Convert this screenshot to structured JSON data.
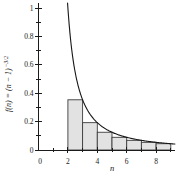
{
  "chart_data": {
    "type": "bar+line",
    "title": "",
    "xlabel": "n",
    "ylabel": "f(n) = (n − 1)^(−3/2)",
    "ylabel_main": "f(n) = (n − 1)",
    "ylabel_superscript": "−3/2",
    "xlim": [
      0,
      9.3
    ],
    "ylim": [
      0,
      1.04
    ],
    "grid": false,
    "x_ticks_major": [
      0,
      2,
      4,
      6,
      8
    ],
    "x_tick_labels": [
      "0",
      "2",
      "4",
      "6",
      "8"
    ],
    "x_ticks_minor": [
      1,
      3,
      5,
      7,
      9
    ],
    "y_ticks_major": [
      0,
      0.2,
      0.4,
      0.6,
      0.8,
      1
    ],
    "y_tick_labels": [
      "0",
      "0.2",
      "0.4",
      "0.6",
      "0.8",
      "1"
    ],
    "y_ticks_minor": [
      0.1,
      0.3,
      0.5,
      0.7,
      0.9
    ],
    "bars": [
      {
        "from": 2,
        "to": 3,
        "value": 0.3536
      },
      {
        "from": 3,
        "to": 4,
        "value": 0.1925
      },
      {
        "from": 4,
        "to": 5,
        "value": 0.125
      },
      {
        "from": 5,
        "to": 6,
        "value": 0.0894
      },
      {
        "from": 6,
        "to": 7,
        "value": 0.068
      },
      {
        "from": 7,
        "to": 8,
        "value": 0.054
      },
      {
        "from": 8,
        "to": 9,
        "value": 0.0442
      }
    ],
    "curve": {
      "formula": "f(x) = (x − 1)^(−3/2)",
      "shift": 1,
      "exponent": -1.5,
      "x_start": 1.977,
      "x_end": 9.28
    },
    "colors": {
      "bar_fill": "#e2e2e2",
      "bar_stroke": "#3c3c3c",
      "curve": "#161616",
      "axis": "#1b1b1b",
      "text": "#1b1b1b",
      "background": "#ffffff"
    }
  }
}
